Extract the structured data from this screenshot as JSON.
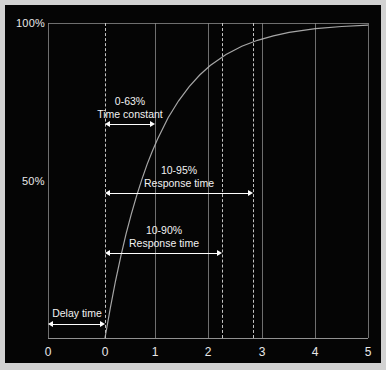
{
  "figure": {
    "background_color": "#050505",
    "frame_color": "#d2d2d2",
    "line_color": "#8d8d8d",
    "annotation_color": "#ffffff"
  },
  "chart_data": {
    "type": "line",
    "title": "",
    "xlabel": "",
    "ylabel": "",
    "xlim": [
      -1.07,
      5
    ],
    "ylim": [
      0,
      110
    ],
    "grid": true,
    "legend_position": "none",
    "x_ticks": [
      "0",
      "0",
      "1",
      "2",
      "3",
      "4",
      "5"
    ],
    "x_tick_values": [
      -1.07,
      0,
      1,
      2,
      3,
      4,
      5
    ],
    "y_ticks": [
      "50%",
      "100%"
    ],
    "y_tick_values": [
      50,
      100
    ],
    "series": [
      {
        "name": "step response",
        "description": "first-order exponential rise y = 100*(1-exp(-t)) starting at t=0",
        "x": [
          0,
          0.1,
          0.2,
          0.3,
          0.4,
          0.5,
          0.6,
          0.7,
          0.8,
          0.9,
          1.0,
          1.2,
          1.4,
          1.6,
          1.8,
          2.0,
          2.3,
          2.6,
          2.9,
          3.2,
          3.5,
          4.0,
          4.5,
          5.0
        ],
        "y": [
          0,
          9.5,
          18.1,
          25.9,
          33.0,
          39.3,
          45.1,
          50.3,
          55.1,
          59.3,
          63.2,
          69.9,
          75.3,
          79.8,
          83.5,
          86.5,
          90.0,
          92.6,
          94.5,
          95.9,
          97.0,
          98.2,
          98.9,
          99.3
        ]
      }
    ],
    "reference_lines": [
      {
        "name": "time-zero",
        "x": 0,
        "style": "dashed"
      },
      {
        "name": "90-percent-crossing",
        "x": 2.26,
        "style": "dashed"
      },
      {
        "name": "95-percent-crossing",
        "x": 2.84,
        "style": "dashed"
      }
    ],
    "annotations": [
      {
        "name": "time-constant",
        "line1": "0-63%",
        "line2": "Time constant",
        "x_start": 0,
        "x_end": 1.0
      },
      {
        "name": "response-time-10-95",
        "line1": "10-95%",
        "line2": "Response time",
        "x_start": 0,
        "x_end": 2.84
      },
      {
        "name": "response-time-10-90",
        "line1": "10-90%",
        "line2": "Response time",
        "x_start": 0,
        "x_end": 2.26
      },
      {
        "name": "delay-time",
        "line1": "",
        "line2": "Delay time",
        "x_start": -1.07,
        "x_end": 0
      }
    ]
  },
  "labels": {
    "y_100": "100%",
    "y_50": "50%",
    "x_0_left": "0",
    "x_0_zero": "0",
    "x_1": "1",
    "x_2": "2",
    "x_3": "3",
    "x_4": "4",
    "x_5": "5",
    "time_constant_pct": "0-63%",
    "time_constant_name": "Time constant",
    "resp95_pct": "10-95%",
    "resp95_name": "Response time",
    "resp90_pct": "10-90%",
    "resp90_name": "Response time",
    "delay_name": "Delay time"
  }
}
